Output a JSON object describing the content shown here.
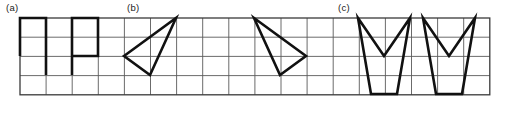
{
  "figure": {
    "caption_labels": [
      {
        "text": "(a)",
        "x": 6,
        "y": 2
      },
      {
        "text": "(b)",
        "x": 127,
        "y": 2
      },
      {
        "text": "(c)",
        "x": 338,
        "y": 2
      }
    ],
    "grid": {
      "x": 20,
      "y": 18,
      "cols": 18,
      "rows": 4,
      "cell_width": 26.1,
      "cell_height": 19.2,
      "line_color": "#5a5a5a",
      "line_width": 0.9,
      "border_color": "#3a3a3a",
      "border_width": 1.3,
      "background": "#ffffff"
    },
    "stroke_color": "#111111",
    "stroke_width": 2.6,
    "shapes": [
      {
        "name": "shape-a-1",
        "group": "a",
        "type": "polyline",
        "closed": false,
        "points": [
          [
            20,
            56
          ],
          [
            20,
            18
          ],
          [
            46,
            18
          ],
          [
            46,
            75
          ]
        ]
      },
      {
        "name": "shape-a-2",
        "group": "a",
        "type": "polyline",
        "closed": false,
        "points": [
          [
            72,
            75
          ],
          [
            72,
            18
          ],
          [
            98,
            18
          ],
          [
            98,
            56
          ],
          [
            72,
            56
          ]
        ]
      },
      {
        "name": "shape-b-1",
        "group": "b",
        "type": "polygon",
        "closed": true,
        "points": [
          [
            124,
            56
          ],
          [
            176,
            18
          ],
          [
            150,
            75
          ]
        ]
      },
      {
        "name": "shape-b-2",
        "group": "b",
        "type": "polygon",
        "closed": true,
        "points": [
          [
            254,
            18
          ],
          [
            306,
            56
          ],
          [
            280,
            75
          ]
        ]
      },
      {
        "name": "shape-c-1",
        "group": "c",
        "type": "polygon",
        "closed": true,
        "points": [
          [
            358,
            18
          ],
          [
            384,
            56
          ],
          [
            410,
            18
          ],
          [
            397,
            94
          ],
          [
            371,
            94
          ]
        ]
      },
      {
        "name": "shape-c-2",
        "group": "c",
        "type": "polygon",
        "closed": true,
        "points": [
          [
            423,
            18
          ],
          [
            449,
            56
          ],
          [
            475,
            18
          ],
          [
            462,
            94
          ],
          [
            436,
            94
          ]
        ]
      }
    ]
  }
}
